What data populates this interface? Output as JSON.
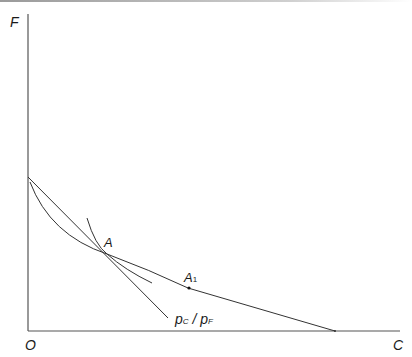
{
  "diagram": {
    "axes": {
      "y_label": "F",
      "x_label": "C",
      "origin_label": "O"
    },
    "points": [
      {
        "label": "A",
        "subscript": ""
      },
      {
        "label": "A",
        "subscript": "1"
      }
    ],
    "line_label": {
      "p1": "p",
      "p1_sub": "C",
      "slash": " / ",
      "p2": "p",
      "p2_sub": "F"
    },
    "colors": {
      "stroke": "#333333",
      "text": "#1a1a1a"
    }
  }
}
